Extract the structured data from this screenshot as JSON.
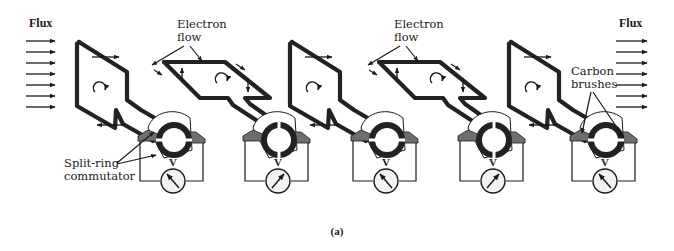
{
  "figure": {
    "caption": "(a)"
  },
  "labels": {
    "flux_left": "Flux",
    "flux_right": "Flux",
    "electron_flow_1": [
      "Electron",
      "flow"
    ],
    "electron_flow_2": [
      "Electron",
      "flow"
    ],
    "carbon_brushes": [
      "Carbon",
      "brushes"
    ],
    "split_ring_commutator": [
      "Split-ring",
      "commutator"
    ],
    "voltmeter": "V"
  },
  "colors": {
    "ink": "#1a1a1a",
    "brush": "#6e6e6e",
    "ring": "#222222",
    "meter_face": "#f2f2f2",
    "background": "#ffffff"
  },
  "stages": [
    {
      "index": 1,
      "coil_orientation": "vertical",
      "rotation_symbol": "clockwise-arrow",
      "meter_needle": "left"
    },
    {
      "index": 2,
      "coil_orientation": "horizontal",
      "rotation_symbol": "clockwise-arrow",
      "meter_needle": "right"
    },
    {
      "index": 3,
      "coil_orientation": "vertical",
      "rotation_symbol": "clockwise-arrow",
      "meter_needle": "left"
    },
    {
      "index": 4,
      "coil_orientation": "horizontal",
      "rotation_symbol": "clockwise-arrow",
      "meter_needle": "right"
    },
    {
      "index": 5,
      "coil_orientation": "vertical",
      "rotation_symbol": "clockwise-arrow",
      "meter_needle": "left"
    }
  ],
  "flux_arrows": {
    "left_count": 7,
    "right_count": 7
  }
}
